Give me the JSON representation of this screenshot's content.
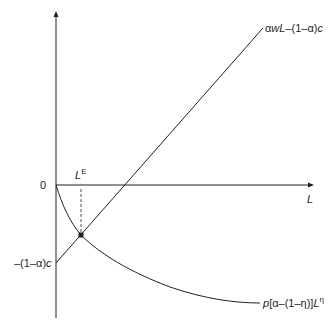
{
  "diagram": {
    "colors": {
      "line": "#231f20",
      "background": "#ffffff"
    },
    "axes": {
      "origin_label": "0",
      "x_label": "L"
    },
    "curves": {
      "line": {
        "label_parts": {
          "alpha": "α",
          "w": "w",
          "L": "L",
          "rest": "–(1–",
          "alpha2": "α",
          "close": ")",
          "c": "c"
        },
        "label_full": "αwL–(1–α)c"
      },
      "curve": {
        "label_parts": {
          "p": "p",
          "open": "[",
          "alpha": "α",
          "mid": "–(1–",
          "eta": "η",
          "close": ")]",
          "L": "L",
          "sup": "η"
        },
        "label_full": "p[α–(1–η)]L^η"
      }
    },
    "intercept_label": {
      "parts": {
        "pre": "–(1–",
        "alpha": "α",
        "close": ")",
        "c": "c"
      },
      "full": "–(1–α)c"
    },
    "equilibrium_label": {
      "base": "L",
      "sup": "E",
      "full": "L^E"
    }
  }
}
